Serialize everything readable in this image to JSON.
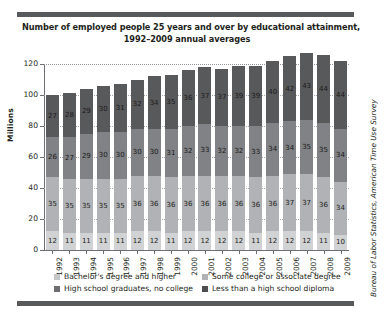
{
  "title": {
    "line1": "Number of employed people 25 years and over by educational attainment,",
    "line2": "1992–2009 annual averages"
  },
  "axes": {
    "y_title": "Millions",
    "y_ticks": [
      "0",
      "20",
      "40",
      "60",
      "80",
      "100",
      "120"
    ]
  },
  "legend": [
    {
      "label": "Bachelor's degree and higher",
      "color": "#c4c6c8"
    },
    {
      "label": "Some college or associate degree",
      "color": "#b0b2b5"
    },
    {
      "label": "High school graduates, no college",
      "color": "#6d6e71"
    },
    {
      "label": "Less than a high school diploma",
      "color": "#4d4e50"
    }
  ],
  "source": {
    "prefix": "",
    "text": "Bureau of Labor Statistics, American Time Use Survey"
  },
  "chart_data": {
    "type": "bar",
    "subtype": "stacked-vertical",
    "title": "Number of employed people 25 years and over by educational attainment, 1992–2009 annual averages",
    "xlabel": "",
    "ylabel": "Millions",
    "ylim": [
      0,
      120
    ],
    "yticks": [
      0,
      20,
      40,
      60,
      80,
      100,
      120
    ],
    "grid": true,
    "legend_position": "bottom",
    "categories": [
      "1992",
      "1993",
      "1994",
      "1995",
      "1996",
      "1997",
      "1998",
      "1999",
      "2000",
      "2001",
      "2002",
      "2003",
      "2004",
      "2005",
      "2006",
      "2007",
      "2008",
      "2009"
    ],
    "series": [
      {
        "name": "Less than a high school diploma",
        "color": "#58595b",
        "values": [
          12,
          11,
          11,
          11,
          11,
          12,
          12,
          11,
          12,
          12,
          12,
          12,
          11,
          12,
          12,
          12,
          11,
          10
        ]
      },
      {
        "name": "High school graduates, no college",
        "color": "#808285",
        "values": [
          35,
          35,
          35,
          35,
          35,
          36,
          36,
          36,
          36,
          36,
          36,
          36,
          36,
          36,
          37,
          37,
          36,
          34
        ]
      },
      {
        "name": "Some college or associate degree",
        "color": "#b0b2b5",
        "values": [
          26,
          27,
          29,
          30,
          30,
          30,
          30,
          31,
          32,
          33,
          32,
          32,
          33,
          34,
          34,
          35,
          35,
          34
        ]
      },
      {
        "name": "Bachelor's degree and higher",
        "color": "#d0d2d3",
        "values": [
          27,
          28,
          29,
          30,
          31,
          32,
          34,
          35,
          36,
          37,
          37,
          39,
          39,
          40,
          42,
          43,
          44,
          44
        ]
      }
    ],
    "totals": [
      100,
      101,
      104,
      106,
      107,
      110,
      112,
      113,
      116,
      118,
      117,
      119,
      119,
      122,
      125,
      127,
      126,
      122
    ]
  }
}
